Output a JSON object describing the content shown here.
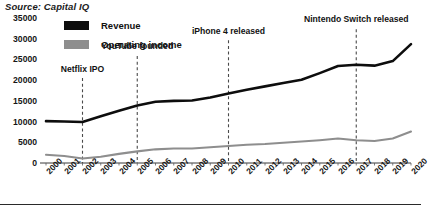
{
  "source": {
    "text": "Source: Capital IQ"
  },
  "legend": {
    "position": "top-left-inside",
    "entries": [
      {
        "label": "Revenue",
        "color": "#0d0d0d",
        "icon": "legend-swatch-revenue"
      },
      {
        "label": "Operating income",
        "color": "#8e8e8e",
        "icon": "legend-swatch-operating-income"
      }
    ]
  },
  "chart_data": {
    "type": "line",
    "title": "",
    "subtitle": "",
    "xlabel": "",
    "ylabel": "",
    "grid": false,
    "xlim": [
      2000,
      2020
    ],
    "ylim": [
      0,
      35000
    ],
    "yticks": [
      0,
      5000,
      10000,
      15000,
      20000,
      25000,
      30000,
      35000
    ],
    "ytick_labels": [
      "0",
      "5000",
      "10000",
      "15000",
      "20000",
      "25000",
      "30000",
      "35000"
    ],
    "x": [
      2000,
      2001,
      2002,
      2003,
      2004,
      2005,
      2006,
      2007,
      2008,
      2009,
      2010,
      2011,
      2012,
      2013,
      2014,
      2015,
      2016,
      2017,
      2018,
      2019,
      2020
    ],
    "xtick_labels": [
      "2000",
      "2001",
      "2002",
      "2003",
      "2004",
      "2005",
      "2006",
      "2007",
      "2008",
      "2009",
      "2010",
      "2011",
      "2012",
      "2013",
      "2014",
      "2015",
      "2016",
      "2017",
      "2018",
      "2019",
      "2020"
    ],
    "series": [
      {
        "name": "Revenue",
        "color": "#0d0d0d",
        "width": 2.6,
        "values": [
          10100,
          10000,
          9900,
          11300,
          12600,
          13900,
          14800,
          15000,
          15100,
          15800,
          16800,
          17700,
          18500,
          19300,
          20100,
          21700,
          23400,
          23700,
          23500,
          24600,
          28700
        ]
      },
      {
        "name": "Operating income",
        "color": "#8e8e8e",
        "width": 2.1,
        "values": [
          2000,
          1700,
          1100,
          1500,
          2200,
          2800,
          3300,
          3500,
          3500,
          3800,
          4100,
          4400,
          4600,
          4900,
          5200,
          5500,
          5900,
          5500,
          5300,
          5900,
          7600
        ]
      }
    ],
    "annotations": [
      {
        "label": "Netflix IPO",
        "x": 2002,
        "label_y_value": 22500,
        "line_top_value": 20500,
        "marker": "dashed-vertical-line"
      },
      {
        "label": "YouTube founded",
        "x": 2005,
        "label_y_value": 28000,
        "line_top_value": 25800,
        "marker": "dashed-vertical-line"
      },
      {
        "label": "iPhone 4 released",
        "x": 2010,
        "label_y_value": 31600,
        "line_top_value": 29600,
        "marker": "dashed-vertical-line"
      },
      {
        "label": "Nintendo Switch released",
        "x": 2017,
        "label_y_value": 34400,
        "line_top_value": 32300,
        "marker": "dashed-vertical-line"
      }
    ]
  }
}
